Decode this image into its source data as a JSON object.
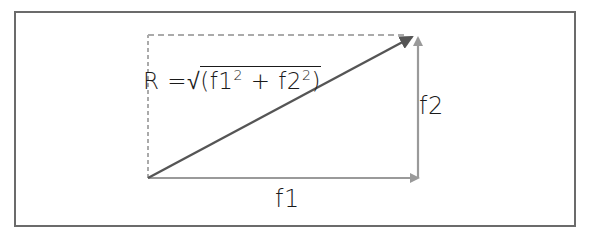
{
  "diagram": {
    "type": "vector-addition",
    "formula": {
      "lhs": "R",
      "equals": "=",
      "radical": "√",
      "open": "(f1",
      "exp1": "2",
      "plus": " + f2",
      "exp2": "2",
      "close": ")"
    },
    "labels": {
      "f1": "f1",
      "f2": "f2"
    },
    "vectors": [
      {
        "name": "f1",
        "from": [
          148,
          178
        ],
        "to": [
          418,
          178
        ],
        "color": "#9a9a9a"
      },
      {
        "name": "f2",
        "from": [
          418,
          178
        ],
        "to": [
          418,
          37
        ],
        "color": "#9a9a9a"
      },
      {
        "name": "R",
        "from": [
          148,
          178
        ],
        "to": [
          411,
          37
        ],
        "color": "#555555"
      }
    ],
    "guides": [
      {
        "name": "dashed-vertical",
        "from": [
          148,
          178
        ],
        "to": [
          148,
          35
        ],
        "color": "#aaaaaa"
      },
      {
        "name": "dashed-horizontal",
        "from": [
          148,
          35
        ],
        "to": [
          410,
          35
        ],
        "color": "#aaaaaa"
      }
    ],
    "frame_color": "#6b6b6b"
  }
}
